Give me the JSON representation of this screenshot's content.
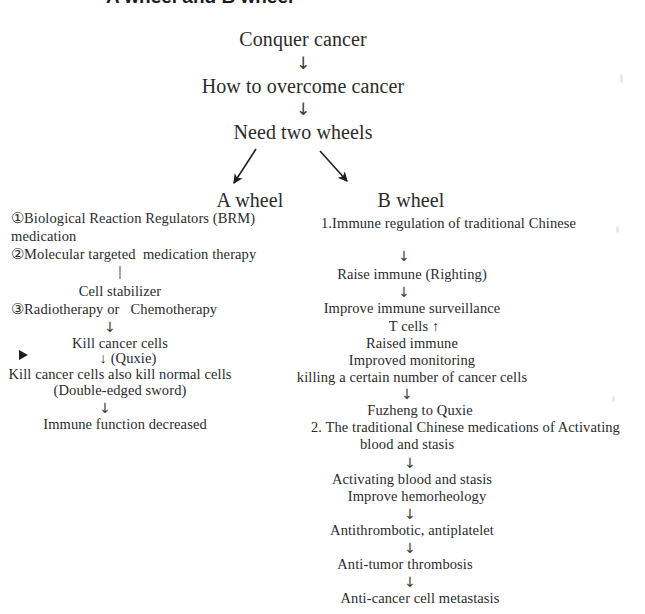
{
  "page": {
    "title_partial": "A wheel and B wheel",
    "background_color": "#ffffff",
    "text_color": "#2b2b2b"
  },
  "trunk": {
    "nodes": [
      {
        "id": "conquer",
        "label": "Conquer cancer"
      },
      {
        "id": "overcome",
        "label": "How to overcome cancer"
      },
      {
        "id": "twowheels",
        "label": "Need two wheels"
      }
    ],
    "connector_glyph": "↓"
  },
  "branch": {
    "left_target": "A wheel",
    "right_target": "B wheel"
  },
  "a_wheel": {
    "heading": "A wheel",
    "marker_glyph": "▶",
    "lines": [
      {
        "id": "a1",
        "text": "①Biological Reaction Regulators (BRM)"
      },
      {
        "id": "a2",
        "text": "medication"
      },
      {
        "id": "a3",
        "text": "②Molecular targeted  medication therapy"
      },
      {
        "id": "a4",
        "text": "Cell stabilizer"
      },
      {
        "id": "a5",
        "text": "③Radiotherapy or   Chemotherapy"
      },
      {
        "id": "a6",
        "text": "Kill cancer cells"
      },
      {
        "id": "a7",
        "text": "↓ (Quxie)"
      },
      {
        "id": "a8",
        "text": "Kill cancer cells also kill normal cells"
      },
      {
        "id": "a9",
        "text": "(Double-edged sword)"
      },
      {
        "id": "a10",
        "text": "Immune function decreased"
      }
    ]
  },
  "b_wheel": {
    "heading": "B wheel",
    "lines": [
      {
        "id": "b1",
        "text": "1.Immune regulation of traditional Chinese"
      },
      {
        "id": "b2",
        "text": "Raise immune (Righting)"
      },
      {
        "id": "b3",
        "text": "Improve immune surveillance"
      },
      {
        "id": "b4",
        "text": "T cells ↑"
      },
      {
        "id": "b5",
        "text": "Raised immune"
      },
      {
        "id": "b6",
        "text": "Improved monitoring"
      },
      {
        "id": "b7",
        "text": "killing a certain number of cancer cells"
      },
      {
        "id": "b8",
        "text": "Fuzheng to Quxie"
      },
      {
        "id": "b9",
        "text": "2. The traditional Chinese medications of Activating"
      },
      {
        "id": "b10",
        "text": "blood and stasis"
      },
      {
        "id": "b11",
        "text": "Activating blood and stasis"
      },
      {
        "id": "b12",
        "text": "Improve hemorheology"
      },
      {
        "id": "b13",
        "text": "Antithrombotic, antiplatelet"
      },
      {
        "id": "b14",
        "text": "Anti-tumor thrombosis"
      },
      {
        "id": "b15",
        "text": "Anti-cancer cell metastasis"
      }
    ]
  },
  "arrows": {
    "down": "↓"
  }
}
